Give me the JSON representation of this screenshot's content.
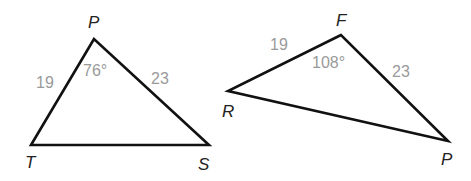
{
  "diagram": {
    "triangles": [
      {
        "id": "PTS",
        "vertices": {
          "P": "P",
          "T": "T",
          "S": "S"
        },
        "side_PT": "19",
        "side_PS": "23",
        "angle_P": "76°"
      },
      {
        "id": "FRP",
        "vertices": {
          "F": "F",
          "R": "R",
          "P": "P"
        },
        "side_RF": "19",
        "side_FP": "23",
        "angle_F": "108°"
      }
    ],
    "colors": {
      "edge": "#111111",
      "vertex_label": "#222222",
      "measure_label": "#9a9a9a"
    }
  }
}
